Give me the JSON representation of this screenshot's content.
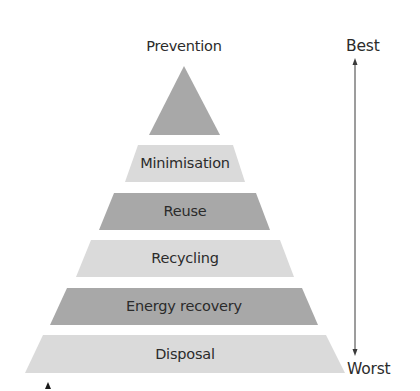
{
  "diagram": {
    "title_top": "Prevention",
    "levels": [
      {
        "label": "Minimisation",
        "shade": "light"
      },
      {
        "label": "Reuse",
        "shade": "dark"
      },
      {
        "label": "Recycling",
        "shade": "light"
      },
      {
        "label": "Energy recovery",
        "shade": "dark"
      },
      {
        "label": "Disposal",
        "shade": "light"
      }
    ],
    "scale": {
      "top_label": "Best",
      "bottom_label": "Worst"
    },
    "colors": {
      "dark": "#a8a8a8",
      "light": "#dadada",
      "text": "#2b2b2b",
      "arrow": "#3a3a3a"
    }
  }
}
